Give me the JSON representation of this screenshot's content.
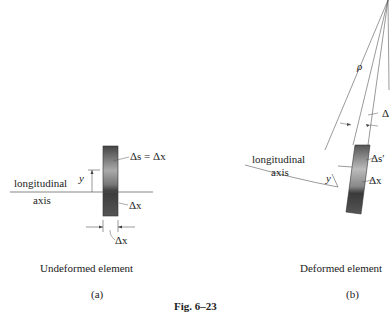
{
  "figure": {
    "caption": "Fig. 6–23"
  },
  "panel_a": {
    "labels": {
      "delta_s_eq": "Δs = Δx",
      "delta_x_right": "Δx",
      "delta_x_bottom": "Δx",
      "y": "y",
      "longitudinal": "longitudinal",
      "axis": "axis"
    },
    "title": "Undeformed element",
    "tag": "(a)"
  },
  "panel_b": {
    "labels": {
      "rho": "ρ",
      "delta_theta": "Δ",
      "delta_s_prime": "Δs′",
      "delta_x": "Δx",
      "y": "y",
      "longitudinal": "longitudinal",
      "axis": "axis"
    },
    "title": "Deformed element",
    "tag": "(b)"
  },
  "colors": {
    "line": "#555555",
    "element_dark": "#3a3a3a",
    "element_light": "#b8b8b8"
  }
}
